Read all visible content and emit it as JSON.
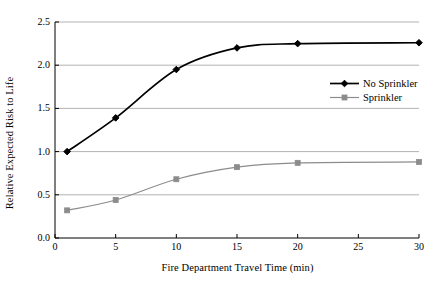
{
  "chart_data": {
    "type": "line",
    "title": "",
    "xlabel": "Fire Department Travel Time (min)",
    "ylabel": "Relative Expected Risk to Life",
    "xlim": [
      0,
      30
    ],
    "ylim": [
      0.0,
      2.5
    ],
    "xticks": [
      "0",
      "5",
      "10",
      "15",
      "20",
      "25",
      "30"
    ],
    "xtick_values": [
      0,
      5,
      10,
      15,
      20,
      25,
      30
    ],
    "yticks": [
      "0.0",
      "0.5",
      "1.0",
      "1.5",
      "2.0",
      "2.5"
    ],
    "ytick_values": [
      0.0,
      0.5,
      1.0,
      1.5,
      2.0,
      2.5
    ],
    "grid": "horizontal",
    "legend_position": "upper-right-inside",
    "x": [
      1,
      5,
      10,
      15,
      20,
      30
    ],
    "series": [
      {
        "name": "No Sprinkler",
        "values": [
          1.0,
          1.39,
          1.95,
          2.2,
          2.25,
          2.26
        ],
        "color": "#000000",
        "marker": "diamond"
      },
      {
        "name": "Sprinkler",
        "values": [
          0.32,
          0.44,
          0.68,
          0.82,
          0.87,
          0.88
        ],
        "color": "#8c8c8c",
        "marker": "square"
      }
    ]
  },
  "legend": {
    "items": [
      {
        "label": "No Sprinkler"
      },
      {
        "label": "Sprinkler"
      }
    ]
  },
  "colors": {
    "axis": "#000000",
    "grid": "#b3b3b3",
    "no_sprinkler": "#000000",
    "sprinkler": "#8c8c8c",
    "background": "#ffffff"
  }
}
